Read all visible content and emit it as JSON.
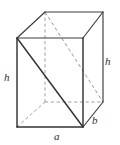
{
  "figure": {
    "kind": "rectangular-prism-diagram",
    "canvas": {
      "width": 120,
      "height": 145,
      "background": "#ffffff"
    },
    "colors": {
      "visible_edge": "#3c3c3c",
      "visible_edge_emphasis": "#333333",
      "hidden_edge": "#9a9a9a",
      "hidden_diagonal": "#909090",
      "label_text": "#2e2e2e"
    },
    "vertices": {
      "front_top_left": {
        "x": 17,
        "y": 38
      },
      "front_top_right": {
        "x": 83,
        "y": 38
      },
      "front_bottom_right": {
        "x": 83,
        "y": 127
      },
      "front_bottom_left": {
        "x": 17,
        "y": 127
      },
      "back_top_left": {
        "x": 45,
        "y": 12
      },
      "back_top_right": {
        "x": 103,
        "y": 12
      },
      "back_bottom_right": {
        "x": 103,
        "y": 102
      },
      "back_bottom_left": {
        "x": 45,
        "y": 102
      }
    },
    "edges": {
      "visible": [
        {
          "name": "front-top-edge",
          "from": "front_top_left",
          "to": "front_top_right"
        },
        {
          "name": "front-right-edge",
          "from": "front_top_right",
          "to": "front_bottom_right"
        },
        {
          "name": "front-bottom-edge",
          "from": "front_bottom_right",
          "to": "front_bottom_left"
        },
        {
          "name": "front-left-edge",
          "from": "front_bottom_left",
          "to": "front_top_left"
        },
        {
          "name": "top-left-receding",
          "from": "front_top_left",
          "to": "back_top_left"
        },
        {
          "name": "back-top-edge",
          "from": "back_top_left",
          "to": "back_top_right"
        },
        {
          "name": "top-right-receding",
          "from": "front_top_right",
          "to": "back_top_right"
        },
        {
          "name": "back-right-edge",
          "from": "back_top_right",
          "to": "back_bottom_right"
        },
        {
          "name": "bottom-right-receding",
          "from": "front_bottom_right",
          "to": "back_bottom_right"
        }
      ],
      "hidden": [
        {
          "name": "back-left-vertical",
          "from": "back_top_left",
          "to": "back_bottom_left"
        },
        {
          "name": "back-bottom-edge",
          "from": "back_bottom_left",
          "to": "back_bottom_right"
        },
        {
          "name": "bottom-left-receding",
          "from": "front_bottom_left",
          "to": "back_bottom_left"
        }
      ]
    },
    "diagonals": [
      {
        "name": "front-face-diagonal",
        "style": "solid",
        "from": "front_top_left",
        "to": "front_bottom_right"
      },
      {
        "name": "space-diagonal-hidden",
        "style": "dashed",
        "from": "back_top_left",
        "to": "back_bottom_right"
      }
    ],
    "labels": [
      {
        "key": "h_left",
        "text": "h",
        "role": "height-left-edge",
        "x": 4,
        "y": 72
      },
      {
        "key": "h_right",
        "text": "h",
        "role": "height-right-edge",
        "x": 105,
        "y": 56
      },
      {
        "key": "a",
        "text": "a",
        "role": "base-front-length",
        "x": 54,
        "y": 131
      },
      {
        "key": "b",
        "text": "b",
        "role": "base-depth-width",
        "x": 92,
        "y": 115
      }
    ]
  }
}
